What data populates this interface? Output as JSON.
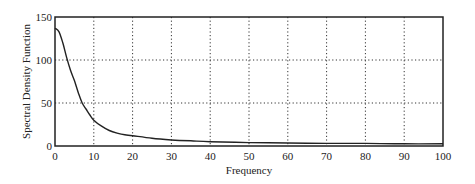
{
  "chart_data": {
    "type": "line",
    "title": "",
    "xlabel": "Frequency",
    "ylabel": "Spectral Density Function",
    "xlim": [
      0,
      100
    ],
    "ylim": [
      0,
      150
    ],
    "xticks": [
      0,
      10,
      20,
      30,
      40,
      50,
      60,
      70,
      80,
      90,
      100
    ],
    "yticks": [
      0,
      50,
      100,
      150
    ],
    "grid": true,
    "grid_style": "dotted",
    "series": [
      {
        "name": "Spectral Density",
        "x": [
          0,
          1,
          2,
          3,
          4,
          5,
          6,
          7,
          8,
          9,
          10,
          12,
          14,
          16,
          18,
          20,
          25,
          30,
          35,
          40,
          50,
          60,
          70,
          80,
          90,
          100
        ],
        "values": [
          137,
          133,
          120,
          103,
          88,
          76,
          62,
          50,
          43,
          36,
          30,
          23,
          18,
          15,
          13,
          12,
          9,
          7,
          6,
          5,
          4,
          3.5,
          3,
          3,
          2.5,
          2.5
        ]
      }
    ]
  },
  "colors": {
    "line": "#222222",
    "grid": "#333333",
    "axis": "#222222"
  }
}
